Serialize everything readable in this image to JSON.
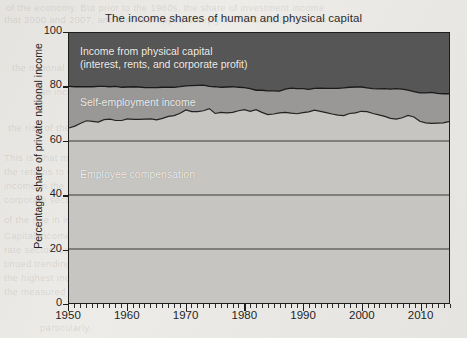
{
  "figure": {
    "title": "The income shares of human and physical capital",
    "ylabel": "Percentage share of private national income",
    "band_labels": {
      "capital_line1": "Income from physical capital",
      "capital_line2": "(interest, rents, and corporate profit)",
      "self_employment": "Self-employment income",
      "employee": "Employee compensation"
    }
  },
  "background_text": {
    "l1": "of the economy. But prior to the 1980s, the share of investment income",
    "l2": "that 2000 and 2007, and then it dropped sharply in the Great Recession",
    "l3": "the national income",
    "l4": "an income",
    "l5": "the rise of the most  counting  in capital",
    "l6": "This is what makes the rise in the income of capital so remarkable.",
    "l7": "of the rise in income share over the past decades is on the order of",
    "l8": "the highest  incomes  that are financed by wages and salaries",
    "l9": "the measured income share of capital in the corporate",
    "l10": "particularly.",
    "l11": "Capital income as a share of national income in the corpo-",
    "l12": "rate sector rose substantially in the 1980s and has con-",
    "l13": "tinued trending in the 1990s and accelerated.",
    "l14": "the returns to capital and labor. The capital share of the",
    "l15": "income in the 1950s and 1960s was nearly stable, but a",
    "l16": "corporate sector as an approximation for both sides of a"
  },
  "colors": {
    "employee": "#c7c5c2",
    "self_employment": "#9a9896",
    "capital": "#575656",
    "frame": "#1d1d1d",
    "gridline": "#3a3a3a",
    "page": "#edebe7"
  },
  "chart_data": {
    "type": "area",
    "stacked": true,
    "title": "The income shares of human and physical capital",
    "xlabel": "",
    "ylabel": "Percentage share of private national income",
    "xlim": [
      1950,
      2015
    ],
    "ylim": [
      0,
      100
    ],
    "yticks": [
      0,
      20,
      40,
      60,
      80,
      100
    ],
    "xticks": [
      1950,
      1960,
      1970,
      1980,
      1990,
      2000,
      2010
    ],
    "xminor_tick_interval": 1,
    "grid": "horizontal gridlines at 20, 40, 60",
    "legend": "inline band labels",
    "x": [
      1950,
      1951,
      1952,
      1953,
      1954,
      1955,
      1956,
      1957,
      1958,
      1959,
      1960,
      1961,
      1962,
      1963,
      1964,
      1965,
      1966,
      1967,
      1968,
      1969,
      1970,
      1971,
      1972,
      1973,
      1974,
      1975,
      1976,
      1977,
      1978,
      1979,
      1980,
      1981,
      1982,
      1983,
      1984,
      1985,
      1986,
      1987,
      1988,
      1989,
      1990,
      1991,
      1992,
      1993,
      1994,
      1995,
      1996,
      1997,
      1998,
      1999,
      2000,
      2001,
      2002,
      2003,
      2004,
      2005,
      2006,
      2007,
      2008,
      2009,
      2010,
      2011,
      2012,
      2013,
      2014,
      2015
    ],
    "series": [
      {
        "name": "Employee compensation",
        "values": [
          64.8,
          65.5,
          66.6,
          67.5,
          67.3,
          67.0,
          67.9,
          68.1,
          67.6,
          67.6,
          68.2,
          68.0,
          68.0,
          68.1,
          68.2,
          67.8,
          68.4,
          69.1,
          69.4,
          70.3,
          71.5,
          70.9,
          70.9,
          71.2,
          72.0,
          70.2,
          70.6,
          70.4,
          70.6,
          71.2,
          71.6,
          71.0,
          71.6,
          70.6,
          69.8,
          70.0,
          70.4,
          70.6,
          70.3,
          70.1,
          70.5,
          70.8,
          71.4,
          71.0,
          70.5,
          70.0,
          69.6,
          69.4,
          70.2,
          70.4,
          71.0,
          70.9,
          70.2,
          69.7,
          69.1,
          68.4,
          68.1,
          68.6,
          69.5,
          68.9,
          67.3,
          66.7,
          66.5,
          66.6,
          66.7,
          67.2
        ]
      },
      {
        "name": "Self-employment income",
        "values": [
          15.4,
          14.6,
          13.5,
          12.6,
          12.8,
          13.2,
          12.3,
          12.0,
          12.6,
          12.3,
          11.8,
          12.1,
          12.0,
          11.7,
          11.6,
          12.0,
          11.5,
          10.8,
          10.5,
          9.8,
          8.9,
          9.6,
          9.7,
          9.5,
          8.2,
          9.9,
          9.3,
          9.6,
          9.5,
          8.7,
          8.2,
          8.4,
          7.2,
          8.2,
          8.8,
          8.6,
          8.1,
          8.6,
          9.3,
          9.3,
          8.9,
          8.3,
          8.1,
          8.6,
          9.0,
          9.5,
          9.9,
          10.3,
          9.7,
          9.6,
          9.0,
          8.8,
          9.2,
          9.6,
          10.3,
          10.8,
          11.3,
          10.6,
          9.3,
          9.4,
          10.5,
          11.1,
          11.5,
          11.0,
          10.8,
          10.3
        ]
      },
      {
        "name": "Income from physical capital (interest, rents, and corporate profit)",
        "values": [
          19.8,
          19.9,
          19.9,
          19.9,
          19.9,
          19.8,
          19.8,
          19.9,
          19.8,
          20.1,
          20.0,
          19.9,
          20.0,
          20.2,
          20.2,
          20.2,
          20.1,
          20.1,
          20.1,
          19.9,
          19.6,
          19.5,
          19.4,
          19.3,
          19.8,
          19.9,
          20.1,
          20.0,
          19.9,
          20.1,
          20.2,
          20.6,
          21.2,
          21.2,
          21.4,
          21.4,
          21.5,
          20.8,
          20.4,
          20.6,
          20.6,
          20.9,
          20.5,
          20.4,
          20.5,
          20.5,
          20.5,
          20.3,
          20.1,
          20.0,
          20.0,
          20.3,
          20.6,
          20.7,
          20.6,
          20.8,
          20.6,
          20.8,
          21.2,
          21.7,
          22.2,
          22.2,
          22.0,
          22.4,
          22.5,
          22.5
        ]
      }
    ]
  }
}
